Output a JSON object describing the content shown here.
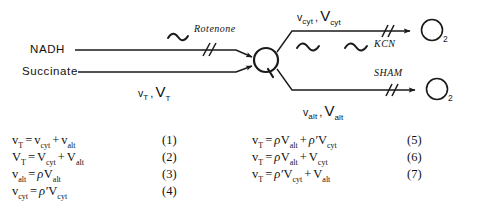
{
  "figure": {
    "type": "biochemical-pathway-diagram",
    "background_color": "#ffffff",
    "line_color": "#1a1a1a"
  },
  "scheme": {
    "substrates": [
      {
        "id": "nadh",
        "label": "NADH"
      },
      {
        "id": "succinate",
        "label": "Succinate"
      }
    ],
    "junction": {
      "id": "q-pool",
      "label": "Q"
    },
    "acceptors": [
      {
        "id": "o2-cyt",
        "label": "O",
        "subscript": "2"
      },
      {
        "id": "o2-alt",
        "label": "O",
        "subscript": "2"
      }
    ],
    "inhibitors": [
      {
        "id": "rotenone",
        "label": "Rotenone",
        "blocks": "nadh-to-q"
      },
      {
        "id": "kcn",
        "label": "KCN",
        "blocks": "cytochrome-path"
      },
      {
        "id": "sham",
        "label": "SHAM",
        "blocks": "alternative-path"
      }
    ],
    "rate_labels": [
      {
        "id": "rate-input",
        "lower": "v",
        "upper": "V",
        "subscript": "T",
        "separator": ","
      },
      {
        "id": "rate-cyt",
        "lower": "v",
        "upper": "V",
        "subscript": "cyt",
        "separator": ","
      },
      {
        "id": "rate-alt",
        "lower": "v",
        "upper": "V",
        "subscript": "alt",
        "separator": ","
      }
    ],
    "energy_coupling_sites": {
      "symbol": "~",
      "counts": {
        "nadh-to-q": 1,
        "cytochrome-path": 2,
        "alternative-path": 0
      }
    }
  },
  "equations": {
    "left": [
      {
        "number": "(1)",
        "parts": [
          {
            "t": "v",
            "sub": "T"
          },
          {
            "op": "="
          },
          {
            "t": "v",
            "sub": "cyt"
          },
          {
            "op": "+"
          },
          {
            "t": "v",
            "sub": "alt"
          }
        ],
        "plain": "vT = vcyt + valt"
      },
      {
        "number": "(2)",
        "parts": [
          {
            "t": "V",
            "sub": "T"
          },
          {
            "op": "="
          },
          {
            "t": "V",
            "sub": "cyt"
          },
          {
            "op": "+"
          },
          {
            "t": "V",
            "sub": "alt"
          }
        ],
        "plain": "VT = Vcyt + Valt"
      },
      {
        "number": "(3)",
        "parts": [
          {
            "t": "v",
            "sub": "alt"
          },
          {
            "op": "="
          },
          {
            "rho": "ρ"
          },
          {
            "t": "V",
            "sub": "alt"
          }
        ],
        "plain": "valt = ρ Valt"
      },
      {
        "number": "(4)",
        "parts": [
          {
            "t": "v",
            "sub": "cyt"
          },
          {
            "op": "="
          },
          {
            "rho": "ρ′"
          },
          {
            "t": "V",
            "sub": "cyt"
          }
        ],
        "plain": "vcyt = ρ′ Vcyt"
      }
    ],
    "right": [
      {
        "number": "(5)",
        "parts": [
          {
            "t": "v",
            "sub": "T"
          },
          {
            "op": "="
          },
          {
            "rho": "ρ"
          },
          {
            "t": "V",
            "sub": "alt"
          },
          {
            "op": "+"
          },
          {
            "rho": "ρ′"
          },
          {
            "t": "V",
            "sub": "cyt"
          }
        ],
        "plain": "vT = ρ Valt + ρ′ Vcyt"
      },
      {
        "number": "(6)",
        "parts": [
          {
            "t": "v",
            "sub": "T"
          },
          {
            "op": "="
          },
          {
            "rho": "ρ"
          },
          {
            "t": "V",
            "sub": "alt"
          },
          {
            "op": "+"
          },
          {
            "t": "V",
            "sub": "cyt"
          }
        ],
        "plain": "vT = ρ Valt + Vcyt"
      },
      {
        "number": "(7)",
        "parts": [
          {
            "t": "v",
            "sub": "T"
          },
          {
            "op": "="
          },
          {
            "rho": "ρ′"
          },
          {
            "t": "V",
            "sub": "cyt"
          },
          {
            "op": "+"
          },
          {
            "t": "V",
            "sub": "alt"
          }
        ],
        "plain": "vT = ρ′ Vcyt + Valt"
      }
    ]
  }
}
